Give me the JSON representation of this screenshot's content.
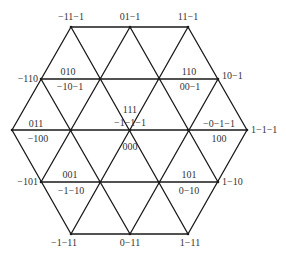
{
  "diagram": {
    "type": "hexagonal-triangular-lattice",
    "line_color": "#1a1a1a",
    "text_color": "#333333",
    "vertices": [
      {
        "id": "t0",
        "x": 71,
        "y": 27
      },
      {
        "id": "t1",
        "x": 130,
        "y": 27
      },
      {
        "id": "t2",
        "x": 188,
        "y": 27
      },
      {
        "id": "r2a",
        "x": 41,
        "y": 79
      },
      {
        "id": "r2b",
        "x": 100,
        "y": 79
      },
      {
        "id": "r2c",
        "x": 159,
        "y": 79
      },
      {
        "id": "r2d",
        "x": 218,
        "y": 79
      },
      {
        "id": "m0",
        "x": 12,
        "y": 130
      },
      {
        "id": "m1",
        "x": 71,
        "y": 130
      },
      {
        "id": "m2",
        "x": 130,
        "y": 130
      },
      {
        "id": "m3",
        "x": 188,
        "y": 130
      },
      {
        "id": "m4",
        "x": 247,
        "y": 130
      },
      {
        "id": "r4a",
        "x": 41,
        "y": 182
      },
      {
        "id": "r4b",
        "x": 100,
        "y": 182
      },
      {
        "id": "r4c",
        "x": 159,
        "y": 182
      },
      {
        "id": "r4d",
        "x": 218,
        "y": 182
      },
      {
        "id": "b0",
        "x": 71,
        "y": 234
      },
      {
        "id": "b1",
        "x": 130,
        "y": 234
      },
      {
        "id": "b2",
        "x": 188,
        "y": 234
      }
    ],
    "labels": [
      {
        "id": "top-left",
        "text": "−11−1",
        "x": 71,
        "y": 20,
        "anchor": "middle"
      },
      {
        "id": "top-center",
        "text": "01−1",
        "x": 130,
        "y": 20,
        "anchor": "middle"
      },
      {
        "id": "top-right",
        "text": "11−1",
        "x": 188,
        "y": 20,
        "anchor": "middle"
      },
      {
        "id": "upper-left",
        "text": "−110",
        "x": 38,
        "y": 82,
        "anchor": "end"
      },
      {
        "id": "upper-left-a",
        "text": "010",
        "x": 68,
        "y": 75,
        "anchor": "middle"
      },
      {
        "id": "upper-left-b",
        "text": "−10−1",
        "x": 70,
        "y": 90,
        "anchor": "middle"
      },
      {
        "id": "upper-right-a",
        "text": "110",
        "x": 189,
        "y": 75,
        "anchor": "middle"
      },
      {
        "id": "upper-right-b",
        "text": "00−1",
        "x": 190,
        "y": 90,
        "anchor": "middle"
      },
      {
        "id": "upper-right",
        "text": "10−1",
        "x": 222,
        "y": 79,
        "anchor": "start"
      },
      {
        "id": "center-a",
        "text": "111",
        "x": 130,
        "y": 113,
        "anchor": "middle"
      },
      {
        "id": "center-b",
        "text": "−1−1−1",
        "x": 130,
        "y": 126,
        "anchor": "middle"
      },
      {
        "id": "center-c",
        "text": "000",
        "x": 130,
        "y": 150,
        "anchor": "middle"
      },
      {
        "id": "left-a",
        "text": "011",
        "x": 36,
        "y": 127,
        "anchor": "middle"
      },
      {
        "id": "left-b",
        "text": "−100",
        "x": 38,
        "y": 142,
        "anchor": "middle"
      },
      {
        "id": "right-a",
        "text": "−0−1−1",
        "x": 219,
        "y": 127,
        "anchor": "middle"
      },
      {
        "id": "right-b",
        "text": "100",
        "x": 219,
        "y": 142,
        "anchor": "middle"
      },
      {
        "id": "right",
        "text": "1−1−1",
        "x": 251,
        "y": 133,
        "anchor": "start"
      },
      {
        "id": "lower-left",
        "text": "−101",
        "x": 38,
        "y": 185,
        "anchor": "end"
      },
      {
        "id": "lower-left-a",
        "text": "001",
        "x": 70,
        "y": 178,
        "anchor": "middle"
      },
      {
        "id": "lower-left-b",
        "text": "−1−10",
        "x": 71,
        "y": 194,
        "anchor": "middle"
      },
      {
        "id": "lower-right-a",
        "text": "101",
        "x": 189,
        "y": 178,
        "anchor": "middle"
      },
      {
        "id": "lower-right-b",
        "text": "0−10",
        "x": 189,
        "y": 194,
        "anchor": "middle"
      },
      {
        "id": "lower-right",
        "text": "1−10",
        "x": 222,
        "y": 185,
        "anchor": "start"
      },
      {
        "id": "bottom-left",
        "text": "−1−11",
        "x": 64,
        "y": 246,
        "anchor": "middle"
      },
      {
        "id": "bottom-center",
        "text": "0−11",
        "x": 130,
        "y": 246,
        "anchor": "middle"
      },
      {
        "id": "bottom-right",
        "text": "1−11",
        "x": 190,
        "y": 246,
        "anchor": "middle"
      }
    ]
  }
}
